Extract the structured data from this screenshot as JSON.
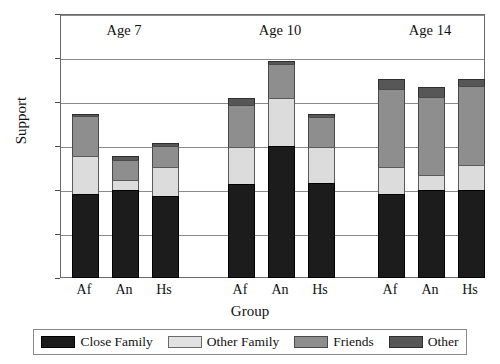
{
  "chart_data": {
    "type": "bar",
    "subtype": "stacked-bar",
    "title": "",
    "xlabel": "Group",
    "ylabel": "Support",
    "ylim": [
      0,
      30
    ],
    "yticks": [
      0,
      5,
      10,
      15,
      20,
      25,
      30
    ],
    "grid": true,
    "legend_position": "bottom",
    "categories": [
      "Af",
      "An",
      "Hs",
      "Af",
      "An",
      "Hs",
      "Af",
      "An",
      "Hs"
    ],
    "panels": [
      "Age 7",
      "Age 10",
      "Age 14"
    ],
    "panel_labels": [
      {
        "label": "Age 7"
      },
      {
        "label": "Age 10"
      },
      {
        "label": "Age 14"
      }
    ],
    "series": [
      {
        "name": "Close Family",
        "color": "#1c1c1c",
        "values": [
          9.6,
          10.0,
          9.3,
          10.7,
          15.0,
          10.8,
          9.5,
          10.0,
          10.0
        ]
      },
      {
        "name": "Other Family",
        "color": "#dcdcdc",
        "values": [
          4.4,
          1.3,
          3.4,
          4.3,
          5.6,
          4.2,
          3.2,
          1.8,
          3.0
        ]
      },
      {
        "name": "Friends",
        "color": "#8e8e8e",
        "values": [
          4.6,
          2.3,
          2.5,
          4.9,
          3.9,
          3.5,
          9.0,
          9.0,
          9.0
        ]
      },
      {
        "name": "Other",
        "color": "#575757",
        "values": [
          0.4,
          0.6,
          0.5,
          0.9,
          0.5,
          0.5,
          1.3,
          1.2,
          1.0
        ]
      }
    ],
    "totals": [
      19.0,
      14.2,
      15.7,
      20.8,
      25.0,
      19.0,
      23.0,
      22.0,
      23.0
    ],
    "bar_labels": [
      "Af",
      "An",
      "Hs",
      "Af",
      "An",
      "Hs",
      "Af",
      "An",
      "Hs"
    ]
  },
  "axes": {
    "y_title": "Support",
    "x_title": "Group",
    "y_tick_labels": [
      "0",
      "5",
      "10",
      "15",
      "20",
      "25",
      "30"
    ]
  },
  "legend": {
    "items": [
      {
        "label": "Close Family",
        "swatch": "s0"
      },
      {
        "label": "Other Family",
        "swatch": "s1"
      },
      {
        "label": "Friends",
        "swatch": "s2"
      },
      {
        "label": "Other",
        "swatch": "s3"
      }
    ]
  }
}
